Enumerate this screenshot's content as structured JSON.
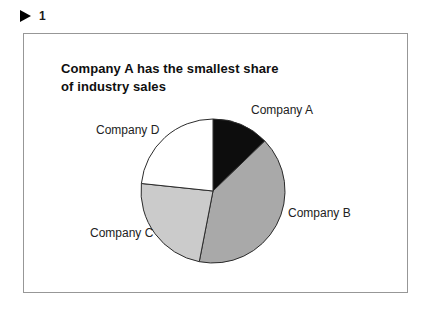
{
  "slide_marker": {
    "icon": "play-triangle",
    "number": "1"
  },
  "figure": {
    "title_line1": "Company A has the smallest share",
    "title_line2": "of industry sales"
  },
  "chart_data": {
    "type": "pie",
    "title": "Company A has the smallest share of industry sales",
    "direction": "clockwise",
    "start_reference": "12-o'clock",
    "outline_color": "#2b2b2b",
    "legend_position": "none",
    "labels_on_chart": true,
    "slices": [
      {
        "label": "Company A",
        "value_pct": 12.8,
        "start_angle": 0,
        "end_angle": 46,
        "color": "#0d0d0d"
      },
      {
        "label": "Company B",
        "value_pct": 40.3,
        "start_angle": 46,
        "end_angle": 191,
        "color": "#a9a9a9"
      },
      {
        "label": "Company C",
        "value_pct": 23.6,
        "start_angle": 191,
        "end_angle": 276,
        "color": "#cbcbcb"
      },
      {
        "label": "Company D",
        "value_pct": 23.3,
        "start_angle": 276,
        "end_angle": 360,
        "color": "#ffffff"
      }
    ]
  }
}
